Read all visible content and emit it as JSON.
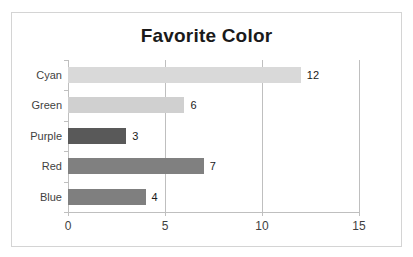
{
  "chart_data": {
    "type": "bar",
    "orientation": "horizontal",
    "title": "Favorite Color",
    "xlabel": "",
    "ylabel": "",
    "categories": [
      "Cyan",
      "Green",
      "Purple",
      "Red",
      "Blue"
    ],
    "values": [
      12,
      6,
      3,
      7,
      4
    ],
    "data_labels": [
      "12",
      "6",
      "3",
      "7",
      "4"
    ],
    "bar_colors": [
      "#d9d9d9",
      "#d0d0d0",
      "#595959",
      "#808080",
      "#7f7f7f"
    ],
    "xlim": [
      0,
      15
    ],
    "xticks": [
      0,
      5,
      10,
      15
    ],
    "xtick_labels": [
      "0",
      "5",
      "10",
      "15"
    ],
    "grid": "vertical",
    "gridlines": [
      5,
      10,
      15
    ],
    "legend": "none",
    "axis_color": "#bfbfbf",
    "title_color": "#1a1a1a",
    "label_color": "#3f3f3f",
    "plot_background": "#ffffff",
    "frame_color": "#d4d4d4"
  }
}
